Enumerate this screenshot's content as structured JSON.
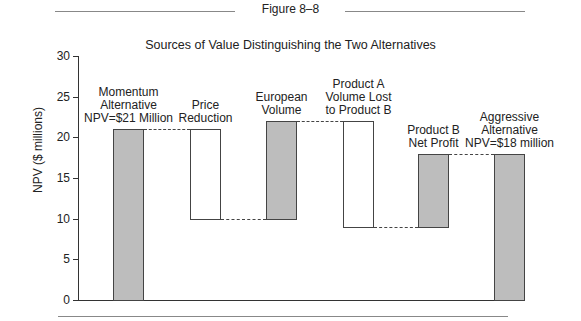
{
  "figure_label": "Figure 8–8",
  "title": "Sources of Value Distinguishing the Two Alternatives",
  "ylabel": "NPV ($ millions)",
  "yticks": [
    "0",
    "5",
    "10",
    "15",
    "20",
    "25",
    "30"
  ],
  "bars": [
    {
      "label_lines": [
        "Momentum",
        "Alternative",
        "NPV=$21 Million"
      ],
      "base": 0,
      "top": 21,
      "fill": "gray"
    },
    {
      "label_lines": [
        "Price",
        "Reduction"
      ],
      "base": 10,
      "top": 21,
      "fill": "white"
    },
    {
      "label_lines": [
        "European",
        "Volume"
      ],
      "base": 10,
      "top": 22,
      "fill": "gray"
    },
    {
      "label_lines": [
        "Product A",
        "Volume Lost",
        "to Product B"
      ],
      "base": 9,
      "top": 22,
      "fill": "white"
    },
    {
      "label_lines": [
        "Product B",
        "Net Profit"
      ],
      "base": 9,
      "top": 18,
      "fill": "gray"
    },
    {
      "label_lines": [
        "Aggressive",
        "Alternative",
        "NPV=$18 million"
      ],
      "base": 0,
      "top": 18,
      "fill": "gray"
    }
  ],
  "chart_data": {
    "type": "bar",
    "subtype": "waterfall",
    "title": "Sources of Value Distinguishing the Two Alternatives",
    "figure_label": "Figure 8–8",
    "xlabel": "",
    "ylabel": "NPV ($ millions)",
    "ylim": [
      0,
      30
    ],
    "yticks": [
      0,
      5,
      10,
      15,
      20,
      25,
      30
    ],
    "grid": false,
    "legend": null,
    "categories": [
      "Momentum Alternative NPV=$21 Million",
      "Price Reduction",
      "European Volume",
      "Product A Volume Lost to Product B",
      "Product B Net Profit",
      "Aggressive Alternative NPV=$18 million"
    ],
    "values": [
      21,
      -11,
      12,
      -13,
      9,
      18
    ],
    "bar_ranges": [
      [
        0,
        21
      ],
      [
        10,
        21
      ],
      [
        10,
        22
      ],
      [
        9,
        22
      ],
      [
        9,
        18
      ],
      [
        0,
        18
      ]
    ],
    "colors": {
      "total_and_increase": "#bdbdbd",
      "decrease": "#ffffff"
    }
  }
}
